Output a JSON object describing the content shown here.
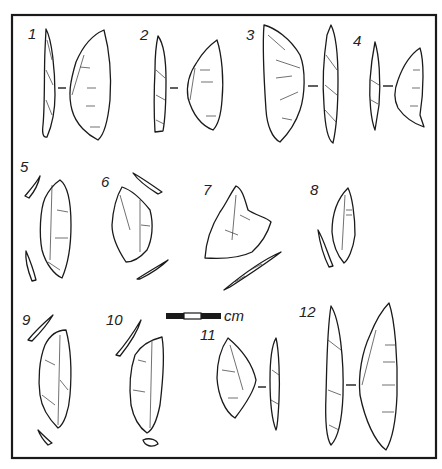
{
  "figure": {
    "type": "lithic artifact illustration plate",
    "labels": [
      "1",
      "2",
      "3",
      "4",
      "5",
      "6",
      "7",
      "8",
      "9",
      "10",
      "11",
      "12"
    ],
    "scale_bar": {
      "unit_label": "cm",
      "segments": [
        "black",
        "white",
        "black"
      ]
    },
    "colors": {
      "ink": "#1a1a1a",
      "paper": "#ffffff"
    }
  }
}
